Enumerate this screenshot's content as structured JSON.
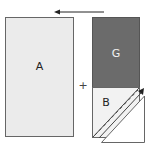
{
  "diagram": {
    "title": "",
    "colors": {
      "light_fill": "#ebebeb",
      "dark_fill": "#6b6b6b",
      "stroke": "#555555",
      "arrow": "#222222",
      "label_dark": "#222222",
      "label_light": "#f2f2f2"
    },
    "arrow_top": {
      "direction": "left",
      "icon": "arrow-left-icon"
    },
    "pieces": [
      {
        "id": "A",
        "label": "A",
        "shape": "rectangle",
        "fill": "light"
      },
      {
        "id": "G",
        "label": "G",
        "shape": "rectangle",
        "fill": "dark"
      },
      {
        "id": "B",
        "label": "B",
        "shape": "square-with-diagonal",
        "fill": "light"
      }
    ],
    "operator": "+",
    "diagonal_arrow": {
      "direction": "up-right",
      "icon": "arrow-diagonal-icon"
    }
  }
}
